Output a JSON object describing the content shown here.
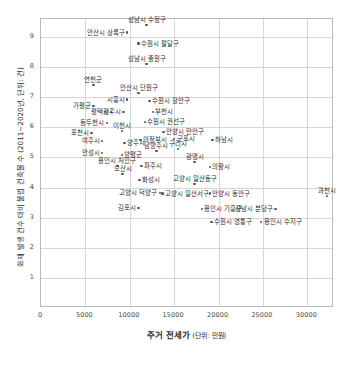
{
  "chart_data": {
    "type": "scatter",
    "title": "",
    "xlabel": "주거 전세가",
    "xlabel_unit": "(단위: 만원)",
    "ylabel": "화재 발생 건수 대비 불법 건축물 수 (2011~2020년, 단위: 건)",
    "xlim": [
      0,
      33000
    ],
    "ylim": [
      0,
      9.6
    ],
    "xticks": [
      0,
      5000,
      10000,
      15000,
      20000,
      25000,
      30000
    ],
    "xtick_labels": [
      "0",
      "5000",
      "10000",
      "15000",
      "20000",
      "25000",
      "30000"
    ],
    "yticks": [
      1,
      2,
      3,
      4,
      5,
      6,
      7,
      8,
      9
    ],
    "ytick_labels": [
      "1",
      "2",
      "3",
      "4",
      "5",
      "6",
      "7",
      "8",
      "9"
    ],
    "grid": true,
    "legend": "none",
    "marker_color": "#555555",
    "grid_color": "#d6d6d6",
    "points": [
      {
        "label": "안산시 상록구",
        "x": 9700,
        "y": 9.15,
        "pos": "left"
      },
      {
        "label": "성남시 수정구",
        "x": 11900,
        "y": 9.4,
        "pos": "above"
      },
      {
        "label": "수원시 팔달구",
        "x": 11000,
        "y": 8.78,
        "pos": "right"
      },
      {
        "label": "성남시 중원구",
        "x": 11900,
        "y": 8.1,
        "pos": "above"
      },
      {
        "label": "연천군",
        "x": 5900,
        "y": 7.4,
        "pos": "above"
      },
      {
        "label": "안산시 단원구",
        "x": 11000,
        "y": 7.15,
        "pos": "above"
      },
      {
        "label": "시흥시",
        "x": 9700,
        "y": 6.92,
        "pos": "left"
      },
      {
        "label": "수원시 장안구",
        "x": 12200,
        "y": 6.88,
        "pos": "right"
      },
      {
        "label": "가평군",
        "x": 5900,
        "y": 6.72,
        "pos": "left"
      },
      {
        "label": "평택시",
        "x": 7900,
        "y": 6.52,
        "pos": "left"
      },
      {
        "label": "광주시",
        "x": 9300,
        "y": 6.52,
        "pos": "left"
      },
      {
        "label": "부천시",
        "x": 12600,
        "y": 6.52,
        "pos": "right"
      },
      {
        "label": "동두천시",
        "x": 7400,
        "y": 6.15,
        "pos": "left"
      },
      {
        "label": "수원시 권선구",
        "x": 11700,
        "y": 6.18,
        "pos": "right"
      },
      {
        "label": "이천시",
        "x": 9100,
        "y": 5.88,
        "pos": "above"
      },
      {
        "label": "안양시 만안구",
        "x": 13800,
        "y": 5.85,
        "pos": "right"
      },
      {
        "label": "포천시",
        "x": 5700,
        "y": 5.82,
        "pos": "left"
      },
      {
        "label": "의정부시",
        "x": 11200,
        "y": 5.58,
        "pos": "right"
      },
      {
        "label": "군포시",
        "x": 15000,
        "y": 5.62,
        "pos": "right"
      },
      {
        "label": "여주시",
        "x": 6900,
        "y": 5.55,
        "pos": "left"
      },
      {
        "label": "양주시",
        "x": 9400,
        "y": 5.48,
        "pos": "right"
      },
      {
        "label": "구리시",
        "x": 15400,
        "y": 5.28,
        "pos": "above"
      },
      {
        "label": "하남시",
        "x": 19300,
        "y": 5.58,
        "pos": "right"
      },
      {
        "label": "안성시",
        "x": 6900,
        "y": 5.15,
        "pos": "left"
      },
      {
        "label": "양평군",
        "x": 9100,
        "y": 5.08,
        "pos": "right"
      },
      {
        "label": "남양주시",
        "x": 13000,
        "y": 5.22,
        "pos": "above"
      },
      {
        "label": "광명시",
        "x": 17300,
        "y": 4.85,
        "pos": "above"
      },
      {
        "label": "용인시 처인구",
        "x": 8600,
        "y": 4.72,
        "pos": "above"
      },
      {
        "label": "파주시",
        "x": 11300,
        "y": 4.72,
        "pos": "right"
      },
      {
        "label": "의왕시",
        "x": 19000,
        "y": 4.68,
        "pos": "right"
      },
      {
        "label": "오산시",
        "x": 9200,
        "y": 4.45,
        "pos": "above"
      },
      {
        "label": "화성시",
        "x": 11100,
        "y": 4.25,
        "pos": "right"
      },
      {
        "label": "고양시 일산동구",
        "x": 17300,
        "y": 4.12,
        "pos": "above"
      },
      {
        "label": "고양시 덕양구",
        "x": 13400,
        "y": 3.82,
        "pos": "left"
      },
      {
        "label": "고양시 일산서구",
        "x": 13700,
        "y": 3.8,
        "pos": "right"
      },
      {
        "label": "안양시 동안구",
        "x": 19000,
        "y": 3.8,
        "pos": "right"
      },
      {
        "label": "과천시",
        "x": 32200,
        "y": 3.72,
        "pos": "above"
      },
      {
        "label": "김포시",
        "x": 11000,
        "y": 3.32,
        "pos": "left"
      },
      {
        "label": "용인시 기흥구",
        "x": 18100,
        "y": 3.28,
        "pos": "right"
      },
      {
        "label": "성남시 분당구",
        "x": 26400,
        "y": 3.28,
        "pos": "left"
      },
      {
        "label": "수원시 영통구",
        "x": 19200,
        "y": 2.85,
        "pos": "right"
      },
      {
        "label": "용인시 수지구",
        "x": 24800,
        "y": 2.85,
        "pos": "right"
      }
    ]
  }
}
